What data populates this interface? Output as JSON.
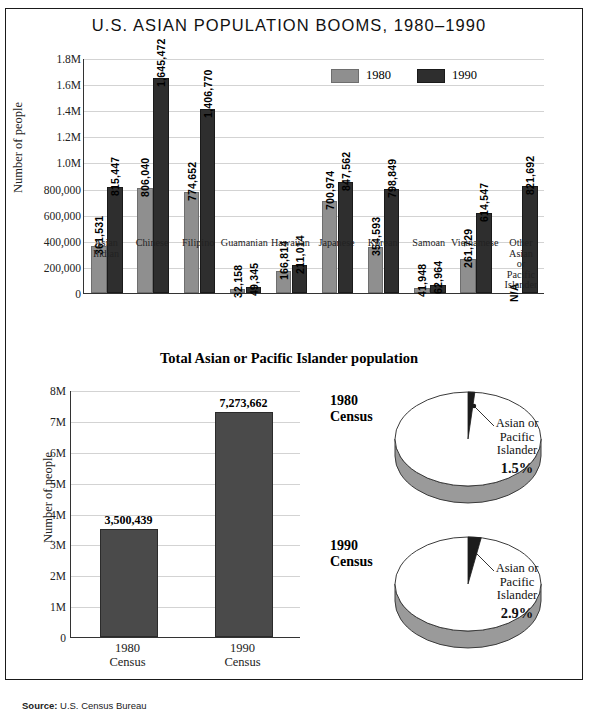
{
  "title": "U.S. ASIAN POPULATION BOOMS, 1980–1990",
  "subtitle": "Total Asian or Pacific Islander population",
  "source": {
    "label": "Source:",
    "text": "U.S. Census Bureau"
  },
  "legend": {
    "items": [
      {
        "label": "1980",
        "color": "#8f8f8f"
      },
      {
        "label": "1990",
        "color": "#2e2e2e"
      }
    ]
  },
  "axis": {
    "ylabel": "Number of people",
    "yticks_top": [
      "1.8M",
      "1.6M",
      "1.4M",
      "1.2M",
      "1.0M",
      "800,000",
      "600,000",
      "400,000",
      "200,000",
      "0"
    ],
    "yticks_bottom": [
      "8M",
      "7M",
      "6M",
      "5M",
      "4M",
      "3M",
      "2M",
      "1M",
      "0"
    ]
  },
  "chart_data": [
    {
      "type": "bar",
      "title": "U.S. ASIAN POPULATION BOOMS, 1980–1990",
      "xlabel": "",
      "ylabel": "Number of people",
      "ylim": [
        0,
        1800000
      ],
      "grid": true,
      "legend_position": "top-right",
      "categories": [
        "Asian Indian",
        "Chinese",
        "Filipino",
        "Guamanian",
        "Hawaiian",
        "Japanese",
        "Korean",
        "Samoan",
        "Vietnamese",
        "Other Asian or Pacific Islander"
      ],
      "series": [
        {
          "name": "1980",
          "color": "#8f8f8f",
          "values": [
            361531,
            806040,
            774652,
            32158,
            166814,
            700974,
            354593,
            41948,
            261729,
            null
          ],
          "labels": [
            "361,531",
            "806,040",
            "774,652",
            "32,158",
            "166,814",
            "700,974",
            "354,593",
            "41,948",
            "261,729",
            "N/A"
          ]
        },
        {
          "name": "1990",
          "color": "#2e2e2e",
          "values": [
            815447,
            1645472,
            1406770,
            49345,
            211014,
            847562,
            798849,
            62964,
            614547,
            821692
          ],
          "labels": [
            "815,447",
            "1,645,472",
            "1,406,770",
            "49,345",
            "211,014",
            "847,562",
            "798,849",
            "62,964",
            "614,547",
            "821,692"
          ]
        }
      ]
    },
    {
      "type": "bar",
      "title": "Total Asian or Pacific Islander population",
      "xlabel": "",
      "ylabel": "Number of people",
      "ylim": [
        0,
        8000000
      ],
      "grid": true,
      "categories": [
        "1980 Census",
        "1990 Census"
      ],
      "values": [
        3500439,
        7273662
      ],
      "labels": [
        "3,500,439",
        "7,273,662"
      ],
      "color": "#4a4a4a"
    },
    {
      "type": "pie",
      "title": "1980 Census",
      "slices": [
        {
          "name": "Asian or Pacific Islander",
          "value": 1.5,
          "label": "1.5%",
          "color": "#1c1c1c"
        },
        {
          "name": "Other",
          "value": 98.5,
          "label": "",
          "color": "#ffffff"
        }
      ],
      "annotation": "Asian or Pacific Islander"
    },
    {
      "type": "pie",
      "title": "1990 Census",
      "slices": [
        {
          "name": "Asian or Pacific Islander",
          "value": 2.9,
          "label": "2.9%",
          "color": "#1c1c1c"
        },
        {
          "name": "Other",
          "value": 97.1,
          "label": "",
          "color": "#ffffff"
        }
      ],
      "annotation": "Asian or Pacific Islander"
    }
  ],
  "pies": [
    {
      "title_line1": "1980",
      "title_line2": "Census",
      "cap_line1": "Asian or",
      "cap_line2": "Pacific",
      "cap_line3": "Islander",
      "pct": "1.5%"
    },
    {
      "title_line1": "1990",
      "title_line2": "Census",
      "cap_line1": "Asian or",
      "cap_line2": "Pacific",
      "cap_line3": "Islander",
      "pct": "2.9%"
    }
  ],
  "bottom_xlabels": [
    {
      "line1": "1980",
      "line2": "Census"
    },
    {
      "line1": "1990",
      "line2": "Census"
    }
  ]
}
